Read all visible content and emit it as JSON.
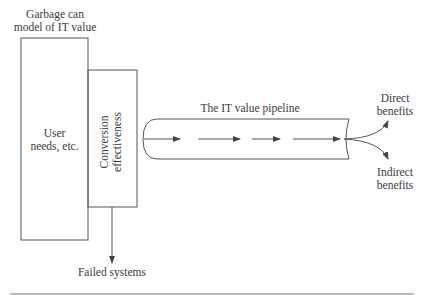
{
  "diagram": {
    "title_line1": "Garbage can",
    "title_line2": "model of IT value",
    "user_box_line1": "User",
    "user_box_line2": "needs, etc.",
    "conversion_line1": "Conversion",
    "conversion_line2": "effectiveness",
    "pipeline_label": "The IT value pipeline",
    "direct_line1": "Direct",
    "direct_line2": "benefits",
    "indirect_line1": "Indirect",
    "indirect_line2": "benefits",
    "failed_label": "Failed systems"
  },
  "colors": {
    "line": "#555555",
    "text": "#3a3a3a",
    "background": "#ffffff"
  }
}
